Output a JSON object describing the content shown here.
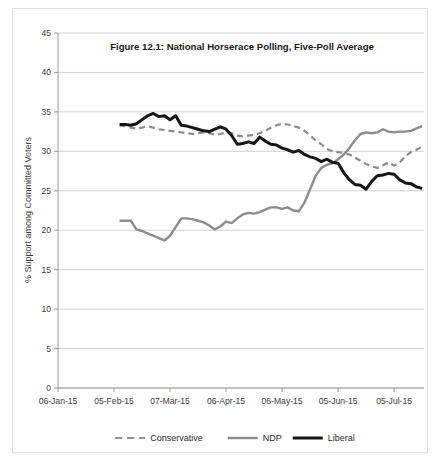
{
  "chart_data": {
    "type": "line",
    "title": "Figure 12.1: National Horserace Polling, Five-Poll Average",
    "xlabel": "",
    "ylabel": "% Support among Committed Voters",
    "ylim": [
      0,
      45
    ],
    "ytick_step": 5,
    "yticks": [
      "0",
      "5",
      "10",
      "15",
      "20",
      "25",
      "30",
      "35",
      "40",
      "45"
    ],
    "xticks": [
      "06-Jan-15",
      "05-Feb-15",
      "07-Mar-15",
      "06-Apr-15",
      "06-May-15",
      "05-Jun-15",
      "05-Jul-15"
    ],
    "xtick_positions_days": [
      0,
      30,
      60,
      90,
      120,
      150,
      180
    ],
    "x_range_days": [
      0,
      196
    ],
    "grid": "horizontal",
    "legend_position": "bottom",
    "series": [
      {
        "name": "Conservative",
        "color": "#8c8c8c",
        "style": "dashed",
        "width": 2.2,
        "x": [
          33,
          36,
          39,
          42,
          45,
          48,
          51,
          54,
          57,
          60,
          63,
          66,
          69,
          72,
          75,
          78,
          81,
          84,
          87,
          90,
          93,
          96,
          99,
          102,
          105,
          108,
          111,
          114,
          117,
          120,
          123,
          126,
          129,
          132,
          135,
          138,
          141,
          144,
          147,
          150,
          153,
          156,
          159,
          162,
          165,
          168,
          171,
          174,
          177,
          180,
          183,
          186,
          189,
          192,
          195
        ],
        "values": [
          33.3,
          33.2,
          33.0,
          32.9,
          33.0,
          33.2,
          33.0,
          32.8,
          32.7,
          32.6,
          32.5,
          32.4,
          32.3,
          32.2,
          32.3,
          32.4,
          32.3,
          32.1,
          32.2,
          32.4,
          32.3,
          32.0,
          31.9,
          32.0,
          32.1,
          32.3,
          32.6,
          33.0,
          33.3,
          33.5,
          33.4,
          33.2,
          33.0,
          32.6,
          32.0,
          31.4,
          30.9,
          30.3,
          30.0,
          29.9,
          29.8,
          29.6,
          29.2,
          28.8,
          28.4,
          28.1,
          27.9,
          28.2,
          28.6,
          28.2,
          28.6,
          29.4,
          29.9,
          30.2,
          30.6
        ],
        "endpoint_values": {
          "start": 33.3,
          "end": 30.6,
          "max": 33.5,
          "min": 27.9
        }
      },
      {
        "name": "NDP",
        "color": "#8c8c8c",
        "style": "solid",
        "width": 2.4,
        "x": [
          33,
          36,
          39,
          42,
          45,
          48,
          51,
          54,
          57,
          60,
          63,
          66,
          69,
          72,
          75,
          78,
          81,
          84,
          87,
          90,
          93,
          96,
          99,
          102,
          105,
          108,
          111,
          114,
          117,
          120,
          123,
          126,
          129,
          132,
          135,
          138,
          141,
          144,
          147,
          150,
          153,
          156,
          159,
          162,
          165,
          168,
          171,
          174,
          177,
          180,
          183,
          186,
          189,
          192,
          195
        ],
        "values": [
          21.2,
          21.2,
          21.2,
          20.1,
          19.9,
          19.6,
          19.3,
          19.0,
          18.7,
          19.3,
          20.4,
          21.5,
          21.5,
          21.4,
          21.2,
          21.0,
          20.6,
          20.1,
          20.5,
          21.1,
          20.9,
          21.5,
          22.0,
          22.2,
          22.1,
          22.3,
          22.6,
          22.9,
          22.9,
          22.7,
          22.9,
          22.5,
          22.4,
          23.5,
          25.2,
          26.9,
          27.9,
          28.3,
          28.5,
          29.0,
          29.6,
          30.4,
          31.4,
          32.2,
          32.4,
          32.3,
          32.4,
          32.8,
          32.5,
          32.4,
          32.5,
          32.5,
          32.6,
          32.9,
          33.2
        ],
        "endpoint_values": {
          "start": 21.2,
          "end": 33.2,
          "max": 33.2,
          "min": 18.7
        }
      },
      {
        "name": "Liberal",
        "color": "#151515",
        "style": "solid",
        "width": 3.0,
        "x": [
          33,
          36,
          39,
          42,
          45,
          48,
          51,
          54,
          57,
          60,
          63,
          66,
          69,
          72,
          75,
          78,
          81,
          84,
          87,
          90,
          93,
          96,
          99,
          102,
          105,
          108,
          111,
          114,
          117,
          120,
          123,
          126,
          129,
          132,
          135,
          138,
          141,
          144,
          147,
          150,
          153,
          156,
          159,
          162,
          165,
          168,
          171,
          174,
          177,
          180,
          183,
          186,
          189,
          192,
          195
        ],
        "values": [
          33.4,
          33.4,
          33.3,
          33.5,
          34.0,
          34.5,
          34.8,
          34.4,
          34.5,
          34.0,
          34.5,
          33.3,
          33.2,
          33.0,
          32.8,
          32.6,
          32.5,
          32.8,
          33.1,
          32.8,
          32.0,
          30.9,
          31.0,
          31.2,
          31.0,
          31.8,
          31.3,
          30.9,
          30.8,
          30.4,
          30.2,
          29.9,
          30.1,
          29.6,
          29.3,
          29.1,
          28.7,
          29.0,
          28.6,
          28.5,
          27.3,
          26.4,
          25.8,
          25.7,
          25.2,
          26.2,
          26.9,
          27.0,
          27.2,
          27.1,
          26.4,
          26.0,
          25.9,
          25.5,
          25.3
        ],
        "endpoint_values": {
          "start": 33.4,
          "end": 25.3,
          "max": 34.8,
          "min": 25.2
        }
      }
    ]
  },
  "legend": {
    "items": [
      {
        "label": "Conservative"
      },
      {
        "label": "NDP"
      },
      {
        "label": "Liberal"
      }
    ]
  }
}
